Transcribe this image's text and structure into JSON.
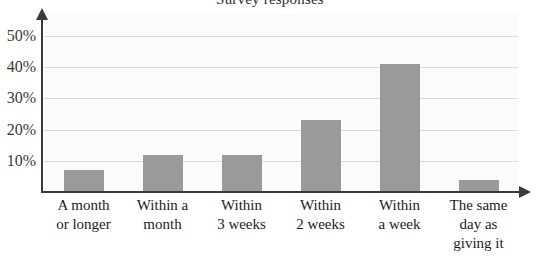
{
  "chart_data": {
    "type": "bar",
    "title": "Survey responses",
    "xlabel": "",
    "ylabel": "",
    "categories": [
      "A month or longer",
      "Within a month",
      "Within 3 weeks",
      "Within 2 weeks",
      "Within a week",
      "The same day as giving it"
    ],
    "category_lines": [
      [
        "A month",
        "or longer"
      ],
      [
        "Within a",
        "month"
      ],
      [
        "Within",
        "3 weeks"
      ],
      [
        "Within",
        "2 weeks"
      ],
      [
        "Within",
        "a week"
      ],
      [
        "The same",
        "day as",
        "giving it"
      ]
    ],
    "values": [
      7,
      12,
      12,
      23,
      41,
      4
    ],
    "value_labels": [
      "7%",
      "12%",
      "12%",
      "23%",
      "41%",
      "4%"
    ],
    "ylim": [
      0,
      57
    ],
    "ytick_values": [
      10,
      20,
      30,
      40,
      50
    ],
    "ytick_labels": [
      "10%",
      "20%",
      "30%",
      "40%",
      "50%"
    ],
    "grid": true,
    "legend": false,
    "bar_color": "#999a9a",
    "axis_color": "#3a3a3a",
    "gridline_color": "#d9d9d9",
    "plot_background": "#fbfbfb"
  }
}
